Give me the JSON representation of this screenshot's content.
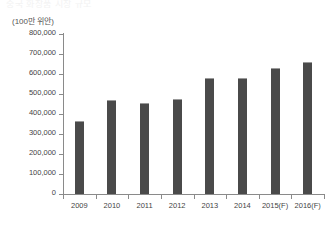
{
  "top_clip_text": "중국 화장품 시장 규모",
  "chart_data": {
    "type": "bar",
    "title": "",
    "subtitle": "",
    "unit_label": "(100만 위안)",
    "xlabel": "",
    "ylabel": "",
    "categories": [
      "2009",
      "2010",
      "2011",
      "2012",
      "2013",
      "2014",
      "2015(F)",
      "2016(F)"
    ],
    "values": [
      365000,
      470000,
      455000,
      477000,
      580000,
      580000,
      630000,
      660000
    ],
    "ylim": [
      0,
      800000
    ],
    "ytick_values": [
      0,
      100000,
      200000,
      300000,
      400000,
      500000,
      600000,
      700000,
      800000
    ],
    "ytick_labels": [
      "0",
      "100,000",
      "200,000",
      "300,000",
      "400,000",
      "500,000",
      "600,000",
      "700,000",
      "800,000"
    ],
    "grid": false,
    "legend": null,
    "bar_color": "#4a4a4a",
    "axis_color": "#8a8a8a",
    "text_color": "#444444",
    "background_color": "#ffffff"
  }
}
